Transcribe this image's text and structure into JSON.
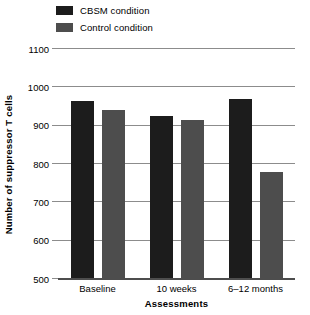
{
  "chart_data": {
    "type": "bar",
    "title": "",
    "xlabel": "Assessments",
    "ylabel": "Number of suppressor T cells",
    "categories": [
      "Baseline",
      "10 weeks",
      "6–12 months"
    ],
    "series": [
      {
        "name": "CBSM condition",
        "color": "#1c1c1c",
        "values": [
          965,
          925,
          970
        ]
      },
      {
        "name": "Control condition",
        "color": "#4d4d4d",
        "values": [
          940,
          915,
          780
        ]
      }
    ],
    "ylim": [
      500,
      1100
    ],
    "yticks": [
      500,
      600,
      700,
      800,
      900,
      1000,
      1100
    ],
    "ytick_labels": [
      "500",
      "600",
      "700",
      "800",
      "900",
      "1000",
      "1100"
    ],
    "grid": true,
    "legend_position": "top-left"
  },
  "legend": {
    "items": [
      {
        "label": "CBSM condition",
        "swatch": "legend-swatch-cbsm"
      },
      {
        "label": "Control condition",
        "swatch": "legend-swatch-control"
      }
    ]
  },
  "axes": {
    "y_title": "Number of suppressor T cells",
    "x_title": "Assessments"
  }
}
